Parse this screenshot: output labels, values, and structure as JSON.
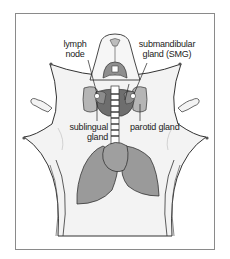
{
  "diagram": {
    "labels": {
      "lymph_node": "lymph\nnode",
      "lymph_node_l1": "lymph",
      "lymph_node_l2": "node",
      "smg_l1": "submandibular",
      "smg_l2": "gland (SMG)",
      "sublingual_l1": "sublingual",
      "sublingual_l2": "gland",
      "parotid": "parotid gland"
    },
    "colors": {
      "frame": "#8a8a8a",
      "skin": "#f2f2f2",
      "outline": "#333333",
      "organ_light": "#a9a9a9",
      "organ_mid": "#8c8c8c",
      "organ_dark": "#6e6e6e",
      "background": "#ffffff"
    }
  }
}
